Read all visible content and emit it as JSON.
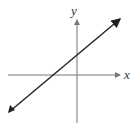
{
  "diagram": {
    "type": "coordinate-plane-line",
    "x_axis_label": "x",
    "y_axis_label": "y",
    "line_description": "straight line with positive slope and positive y-intercept, arrows on both ends",
    "colors": {
      "axis": "#777777",
      "line": "#222222",
      "label": "#333333"
    }
  }
}
